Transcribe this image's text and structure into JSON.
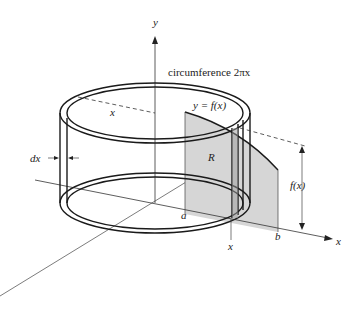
{
  "figure": {
    "labels": {
      "y_axis": "y",
      "x_axis": "x",
      "circumference": "circumference 2πx",
      "function": "y = f(x)",
      "radius_dashed": "x",
      "thickness": "dx",
      "region": "R",
      "lower_limit": "a",
      "upper_limit": "b",
      "shell_position": "x",
      "height": "f(x)"
    },
    "colors": {
      "region_fill": "#d6d6d6",
      "shell_stroke": "#1a1a1a",
      "axis_stroke": "#333333",
      "background": "#ffffff"
    }
  }
}
